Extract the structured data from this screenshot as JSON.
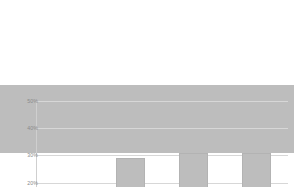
{
  "chart_data": {
    "type": "bar",
    "title": "",
    "subtitle": "",
    "xlabel": "",
    "ylabel": "",
    "categories": [
      "lente",
      "zomer",
      "herfst",
      "winter"
    ],
    "values": [
      25,
      17,
      29,
      31
    ],
    "value_suffix": "%",
    "ylim": [
      0,
      50
    ],
    "ytick_values": [
      0,
      10,
      20,
      30,
      40,
      50
    ],
    "ytick_labels": [
      "0%",
      "10%",
      "20%",
      "30%",
      "40%",
      "50%"
    ],
    "grid": true,
    "grid_axis": "y",
    "legend": false,
    "legend_position": "none",
    "series": [
      {
        "name": "",
        "values": [
          25,
          17,
          29,
          31
        ]
      }
    ],
    "colors": {
      "bar_fill": "#bdbdbd",
      "bar_border": "#b3b3b3",
      "gridline": "#d7d7d7",
      "axis": "#cfcfcf",
      "tick_label": "#8a8a8a",
      "background": "#ffffff"
    }
  }
}
